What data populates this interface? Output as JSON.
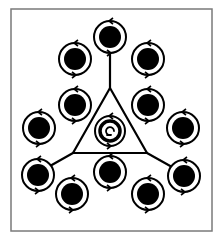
{
  "frame": {
    "x": 11,
    "y": 9,
    "width": 201,
    "height": 222,
    "stroke": "#7a7a7a",
    "stroke_width": 1.5
  },
  "colors": {
    "ink": "#000000",
    "paper": "#ffffff"
  },
  "nodes": [
    {
      "id": "top",
      "cx": 110,
      "cy": 37
    },
    {
      "id": "upper-left",
      "cx": 75,
      "cy": 59
    },
    {
      "id": "upper-right",
      "cx": 148,
      "cy": 59
    },
    {
      "id": "mid-left",
      "cx": 75,
      "cy": 105
    },
    {
      "id": "mid-right",
      "cx": 148,
      "cy": 105
    },
    {
      "id": "side-left",
      "cx": 39,
      "cy": 128
    },
    {
      "id": "side-right",
      "cx": 183,
      "cy": 128
    },
    {
      "id": "lower-left",
      "cx": 38,
      "cy": 175
    },
    {
      "id": "lower-right",
      "cx": 184,
      "cy": 176
    },
    {
      "id": "bottom-center",
      "cx": 110,
      "cy": 172
    },
    {
      "id": "bottom-left",
      "cx": 72,
      "cy": 194
    },
    {
      "id": "bottom-right",
      "cx": 148,
      "cy": 194
    }
  ],
  "node_style": {
    "ring_radius": 16,
    "ring_width": 2,
    "disc_radius": 11
  },
  "center_node": {
    "id": "center",
    "cx": 110,
    "cy": 131,
    "ring_radius": 15,
    "inner_ring_radius": 10,
    "inner_ring_width": 3.5
  },
  "triangle": {
    "apex": [
      110,
      88
    ],
    "base_left": [
      73,
      153
    ],
    "base_right": [
      147,
      153
    ]
  },
  "connectors": [
    {
      "id": "top-to-apex",
      "from": [
        110,
        54
      ],
      "to": [
        110,
        88
      ]
    },
    {
      "id": "base-left-to-lower-left",
      "from": [
        73,
        153
      ],
      "to": [
        50,
        166
      ]
    },
    {
      "id": "base-right-to-lower-right",
      "from": [
        147,
        153
      ],
      "to": [
        172,
        167
      ]
    }
  ]
}
